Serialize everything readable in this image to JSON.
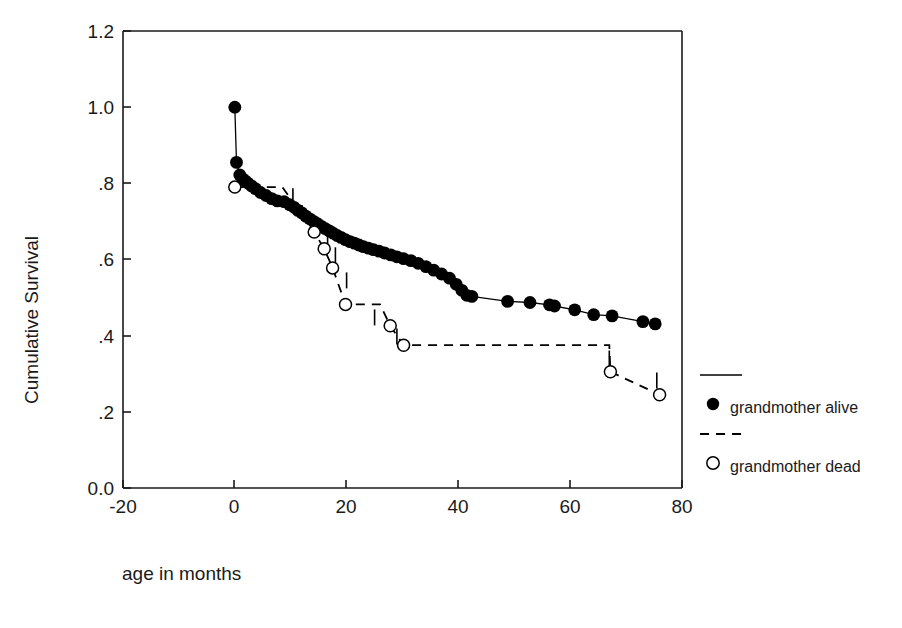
{
  "chart_data": {
    "type": "line",
    "title": "",
    "xlabel": "age in months",
    "ylabel": "Cumulative Survival",
    "xlim": [
      -20,
      80
    ],
    "ylim": [
      0.0,
      1.2
    ],
    "xticks": [
      -20,
      0,
      20,
      40,
      60,
      80
    ],
    "xtick_labels": [
      "-20",
      "0",
      "20",
      "40",
      "60",
      "80"
    ],
    "yticks": [
      0.0,
      0.2,
      0.4,
      0.6,
      0.8,
      1.0,
      1.2
    ],
    "ytick_labels": [
      "0.0",
      ".2",
      ".4",
      ".6",
      ".8",
      "1.0",
      "1.2"
    ],
    "grid": false,
    "legend_position": "right",
    "series": [
      {
        "name": "grandmother alive",
        "line_style": "solid",
        "marker": "filled-circle",
        "points": [
          [
            0.0,
            1.0
          ],
          [
            0.3,
            0.855
          ],
          [
            0.9,
            0.822
          ],
          [
            1.4,
            0.812
          ],
          [
            1.9,
            0.806
          ],
          [
            2.4,
            0.8
          ],
          [
            3.0,
            0.793
          ],
          [
            3.7,
            0.786
          ],
          [
            4.6,
            0.776
          ],
          [
            5.6,
            0.768
          ],
          [
            6.6,
            0.76
          ],
          [
            7.6,
            0.754
          ],
          [
            8.8,
            0.752
          ],
          [
            9.8,
            0.744
          ],
          [
            10.6,
            0.737
          ],
          [
            11.3,
            0.729
          ],
          [
            12.0,
            0.722
          ],
          [
            12.7,
            0.714
          ],
          [
            13.4,
            0.707
          ],
          [
            14.1,
            0.7
          ],
          [
            14.8,
            0.694
          ],
          [
            15.5,
            0.687
          ],
          [
            16.2,
            0.681
          ],
          [
            16.9,
            0.675
          ],
          [
            17.6,
            0.669
          ],
          [
            18.3,
            0.663
          ],
          [
            19.0,
            0.658
          ],
          [
            19.8,
            0.652
          ],
          [
            20.6,
            0.647
          ],
          [
            21.4,
            0.643
          ],
          [
            22.2,
            0.638
          ],
          [
            23.0,
            0.634
          ],
          [
            23.9,
            0.63
          ],
          [
            24.8,
            0.626
          ],
          [
            25.8,
            0.622
          ],
          [
            26.8,
            0.617
          ],
          [
            27.9,
            0.612
          ],
          [
            29.0,
            0.607
          ],
          [
            30.2,
            0.602
          ],
          [
            31.5,
            0.597
          ],
          [
            32.8,
            0.59
          ],
          [
            34.2,
            0.581
          ],
          [
            35.6,
            0.572
          ],
          [
            37.0,
            0.562
          ],
          [
            38.4,
            0.551
          ],
          [
            39.6,
            0.535
          ],
          [
            40.6,
            0.519
          ],
          [
            41.5,
            0.506
          ],
          [
            42.4,
            0.503
          ],
          [
            48.8,
            0.49
          ],
          [
            52.8,
            0.487
          ],
          [
            56.3,
            0.481
          ],
          [
            57.2,
            0.478
          ],
          [
            60.8,
            0.468
          ],
          [
            64.2,
            0.455
          ],
          [
            67.5,
            0.452
          ],
          [
            73.0,
            0.437
          ],
          [
            75.2,
            0.431
          ]
        ]
      },
      {
        "name": "grandmother dead",
        "line_style": "dashed",
        "marker": "open-circle",
        "points": [
          [
            0.0,
            0.79
          ],
          [
            8.5,
            0.79
          ],
          [
            14.2,
            0.672
          ],
          [
            16.0,
            0.628
          ],
          [
            17.5,
            0.578
          ],
          [
            19.8,
            0.482
          ],
          [
            26.0,
            0.482
          ],
          [
            27.8,
            0.426
          ],
          [
            30.2,
            0.375
          ],
          [
            67.0,
            0.375
          ],
          [
            67.2,
            0.305
          ],
          [
            76.0,
            0.245
          ]
        ],
        "marker_points": [
          [
            0.0,
            0.79
          ],
          [
            14.2,
            0.672
          ],
          [
            16.0,
            0.628
          ],
          [
            17.5,
            0.578
          ],
          [
            19.8,
            0.482
          ],
          [
            27.8,
            0.426
          ],
          [
            30.2,
            0.375
          ],
          [
            67.2,
            0.305
          ],
          [
            76.0,
            0.245
          ]
        ],
        "censor_marks": [
          [
            10.4,
            0.766
          ],
          [
            12.0,
            0.722
          ],
          [
            14.1,
            0.69
          ],
          [
            16.6,
            0.662
          ],
          [
            18.0,
            0.611
          ],
          [
            20.0,
            0.545
          ],
          [
            25.0,
            0.448
          ],
          [
            29.0,
            0.398
          ],
          [
            67.0,
            0.34
          ],
          [
            75.5,
            0.282
          ]
        ]
      }
    ]
  },
  "legend": {
    "entries": [
      {
        "label": "grandmother alive",
        "style": "solid",
        "marker": "filled-circle"
      },
      {
        "label": "grandmother dead",
        "style": "dashed",
        "marker": "open-circle"
      }
    ]
  }
}
